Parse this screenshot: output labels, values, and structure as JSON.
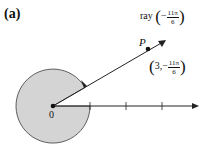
{
  "panel_label": "(a)",
  "point_label": "P",
  "origin_label": "0",
  "ray_label": {
    "prefix": "ray",
    "sign": "−",
    "numerator": "11π",
    "denominator": "6"
  },
  "point_coords": {
    "r": "3,",
    "sign": "−",
    "numerator": "11π",
    "denominator": "6"
  },
  "colors": {
    "shaded_sector": "#d4d4d4",
    "lines": "#222222"
  }
}
